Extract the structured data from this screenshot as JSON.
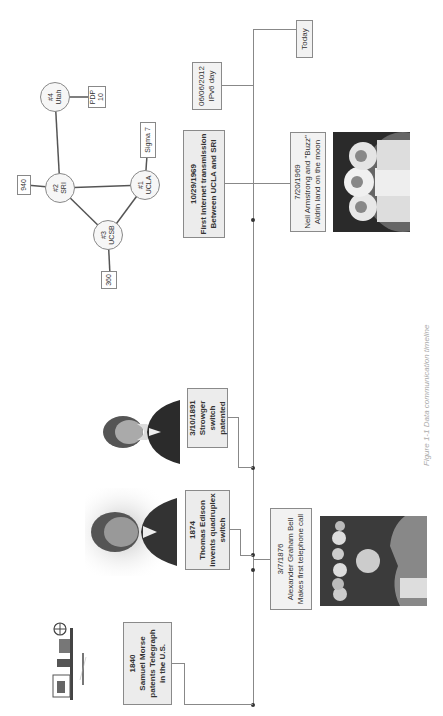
{
  "figure": {
    "caption": "Figure 1-1 Data communication timeline"
  },
  "events": {
    "telegraph": {
      "date": "1840",
      "line1": "Samuel Morse",
      "line2": "patents Telegraph",
      "line3": "in the U.S."
    },
    "edison": {
      "date": "1874",
      "line1": "Thomas Edison",
      "line2": "invents quadruplex switch"
    },
    "bell": {
      "date": "3/7/1876",
      "line1": "Alexander Graham Bell",
      "line2": "Makes first telephone call"
    },
    "strowger": {
      "date": "3/10/1891",
      "line1": "Strowger switch",
      "line2": "patented"
    },
    "internet": {
      "date": "10/29/1969",
      "line1": "First Internet transmission",
      "line2": "Between UCLA and SRI"
    },
    "moon": {
      "date": "7/20/1969",
      "line1": "Neil Armstrong and \"Buzz\"",
      "line2": "Aldrin land on the moon"
    },
    "ipv6": {
      "date": "06/06/2012",
      "line1": "IPv6 day"
    },
    "today": {
      "label": "Today"
    }
  },
  "network": {
    "nodes": {
      "ucla": {
        "num": "#1",
        "name": "UCLA"
      },
      "sri": {
        "num": "#2",
        "name": "SRI"
      },
      "ucsb": {
        "num": "#3",
        "name": "UCSB"
      },
      "utah": {
        "num": "#4",
        "name": "Utah"
      }
    },
    "hosts": {
      "sigma7": "Sigma 7",
      "h940": "940",
      "h360": "360",
      "pdp10_l1": "PDP",
      "pdp10_l2": "10"
    }
  },
  "images": {
    "telegraph": "telegraph-apparatus-illustration",
    "edison": "thomas-edison-portrait",
    "strowger": "almon-strowger-portrait",
    "bell": "bell-telephone-scene",
    "moon": "apollo-11-astronauts"
  }
}
